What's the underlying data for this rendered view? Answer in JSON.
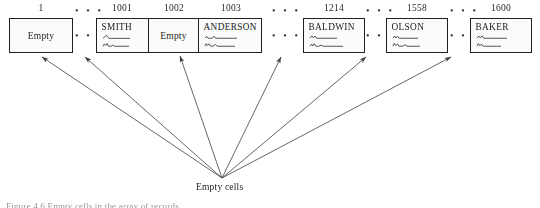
{
  "figure": {
    "type": "array-diagram",
    "cells": [
      {
        "index": "1",
        "kind": "empty",
        "label": "Empty",
        "x": 9,
        "width": 64
      },
      {
        "index": "1001",
        "kind": "record",
        "label": "SMITH",
        "x": 96,
        "width": 52
      },
      {
        "index": "1002",
        "kind": "empty",
        "label": "Empty",
        "x": 148,
        "width": 52
      },
      {
        "index": "1003",
        "kind": "record",
        "label": "ANDERSON",
        "x": 200,
        "width": 62
      },
      {
        "index": "1214",
        "kind": "record",
        "label": "BALDWIN",
        "x": 303,
        "width": 62
      },
      {
        "index": "1558",
        "kind": "record",
        "label": "OLSON",
        "x": 386,
        "width": 62
      },
      {
        "index": "1600",
        "kind": "record",
        "label": "BAKER",
        "x": 470,
        "width": 62
      }
    ],
    "separators": [
      {
        "x": 73,
        "width": 23
      },
      {
        "x": 262,
        "width": 41
      },
      {
        "x": 365,
        "width": 21
      },
      {
        "x": 448,
        "width": 22
      }
    ],
    "ellipsis": "• • •",
    "converge_label": "Empty cells",
    "converge_point": {
      "x": 222,
      "y": 178
    },
    "arrow_targets": [
      {
        "x": 42,
        "y": 57
      },
      {
        "x": 85,
        "y": 57
      },
      {
        "x": 180,
        "y": 56
      },
      {
        "x": 281,
        "y": 57
      },
      {
        "x": 366,
        "y": 57
      },
      {
        "x": 451,
        "y": 57
      }
    ],
    "caption": "Figure 4.6  Empty cells in the array of records."
  },
  "colors": {
    "ink": "#1d1d1d",
    "arrow": "#4a4a4a",
    "paper": "#ffffff"
  }
}
